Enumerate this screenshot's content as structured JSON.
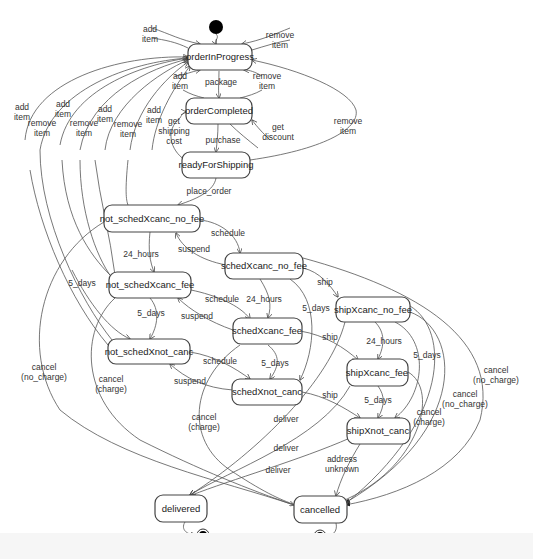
{
  "diagram": {
    "type": "UML state machine",
    "states": {
      "orderInProgress": "orderInProgress",
      "orderCompleted": "orderCompleted",
      "readyForShipping": "readyForShipping",
      "not_schedXcanc_no_fee": "not_schedXcanc_no_fee",
      "not_schedXcanc_fee": "not_schedXcanc_fee",
      "not_schedXnot_canc": "not_schedXnot_canc",
      "schedXcanc_no_fee": "schedXcanc_no_fee",
      "schedXcanc_fee": "schedXcanc_fee",
      "schedXnot_canc": "schedXnot_canc",
      "shipXcanc_no_fee": "shipXcanc_no_fee",
      "shipXcanc_fee": "shipXcanc_fee",
      "shipXnot_canc": "shipXnot_canc",
      "delivered": "delivered",
      "cancelled": "cancelled"
    },
    "labels": {
      "add_item_top": [
        "add",
        "item"
      ],
      "remove_item_top": [
        "remove",
        "item"
      ],
      "add_item_oc": [
        "add",
        "item"
      ],
      "package": "package",
      "remove_item_oc": [
        "remove",
        "item"
      ],
      "remove_item_rfs": [
        "remove",
        "item"
      ],
      "add_item_1": [
        "add",
        "item"
      ],
      "remove_item_1": [
        "remove",
        "item"
      ],
      "add_item_2": [
        "add",
        "item"
      ],
      "remove_item_2": [
        "remove",
        "item"
      ],
      "add_item_3": [
        "add",
        "item"
      ],
      "remove_item_3": [
        "remove",
        "item"
      ],
      "add_item_4": [
        "add",
        "item"
      ],
      "get_shipping_cost": [
        "get",
        "shipping",
        "cost"
      ],
      "get_discount": [
        "get",
        "discount"
      ],
      "purchase": "purchase",
      "place_order": "place_order",
      "schedule_1": "schedule",
      "suspend_1": "suspend",
      "hours24_1": "24_hours",
      "days5_left": "5_days",
      "schedule_2": "schedule",
      "suspend_2": "suspend",
      "hours24_2": "24_hours",
      "days5_2": "5_days",
      "ship_1": "ship",
      "days5_3": "5_days",
      "schedule_3": "schedule",
      "suspend_3": "suspend",
      "ship_2": "ship",
      "days5_4": "5_days",
      "hours24_3": "24_hours",
      "days5_5": "5_days",
      "days5_6": "5_days",
      "ship_3": "ship",
      "cancel_no_charge_left": [
        "cancel",
        "(no_charge)"
      ],
      "cancel_charge_left": [
        "cancel",
        "(charge)"
      ],
      "cancel_charge_mid": [
        "cancel",
        "(charge)"
      ],
      "deliver_1": "deliver",
      "deliver_2": "deliver",
      "deliver_3": "deliver",
      "address_unknown": [
        "address",
        "unknown"
      ],
      "cancel_charge_right": [
        "cancel",
        "(charge)"
      ],
      "cancel_no_charge_r1": [
        "cancel",
        "(no_charge)"
      ],
      "cancel_no_charge_r2": [
        "cancel",
        "(no_charge)"
      ]
    }
  }
}
